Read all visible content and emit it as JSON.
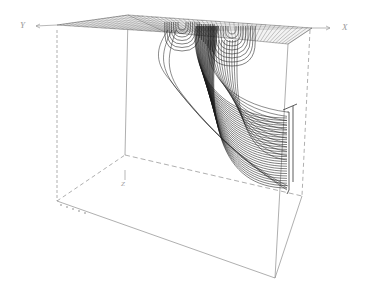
{
  "figure": {
    "title": "",
    "axes": {
      "x_label": "X",
      "y_label": "Y",
      "z_label": "Z"
    },
    "colors": {
      "background": "#ffffff",
      "streamline": "#1a1a1a",
      "box_edge": "#8c8c8c",
      "grid": "#555555"
    }
  }
}
